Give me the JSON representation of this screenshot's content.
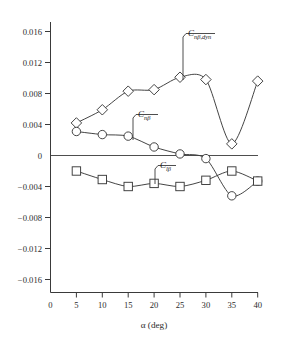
{
  "chart_data": {
    "type": "line",
    "title": "",
    "xlabel": "α (deg)",
    "ylabel": "",
    "xlim": [
      0,
      40
    ],
    "ylim": [
      -0.016,
      0.016
    ],
    "grid": false,
    "legend_position": "inline-annotations",
    "x_ticks": [
      "0",
      "5",
      "10",
      "15",
      "20",
      "25",
      "30",
      "35",
      "40"
    ],
    "x_tick_values": [
      0,
      5,
      10,
      15,
      20,
      25,
      30,
      35,
      40
    ],
    "y_ticks": [
      "0.016",
      "0.012",
      "0.008",
      "0.004",
      "0",
      "−0.004",
      "−0.008",
      "−0.012",
      "−0.016"
    ],
    "y_tick_values": [
      0.016,
      0.012,
      0.008,
      0.004,
      0,
      -0.004,
      -0.008,
      -0.012,
      -0.016
    ],
    "x": [
      5,
      10,
      15,
      20,
      25,
      30,
      35,
      40
    ],
    "series": [
      {
        "name": "Cnbeta_dyn",
        "label_main": "C",
        "label_sub": "nβ,dyn",
        "marker": "diamond",
        "values": [
          0.0042,
          0.0059,
          0.0083,
          0.0085,
          0.0101,
          0.0098,
          0.0015,
          0.0096
        ]
      },
      {
        "name": "Cnbeta",
        "label_main": "C",
        "label_sub": "nβ",
        "marker": "circle",
        "values": [
          0.0031,
          0.0027,
          0.0025,
          0.0011,
          0.0002,
          -0.0004,
          -0.0052,
          -0.0033
        ]
      },
      {
        "name": "Clbeta",
        "label_main": "C",
        "label_sub": "lβ",
        "marker": "square",
        "values": [
          -0.002,
          -0.0031,
          -0.004,
          -0.0036,
          -0.004,
          -0.0032,
          -0.002,
          -0.0033
        ]
      }
    ],
    "annotations": [
      {
        "name": "cnbdyn-annotation",
        "main": "C",
        "sub": "nβ,dyn"
      },
      {
        "name": "cnb-annotation",
        "main": "C",
        "sub": "nβ"
      },
      {
        "name": "clb-annotation",
        "main": "C",
        "sub": "lβ"
      }
    ],
    "colors": {
      "axis": "#3a3a3a",
      "curve": "#3a3a3a",
      "marker_fill": "#ffffff",
      "text": "#1a1a1a"
    }
  }
}
